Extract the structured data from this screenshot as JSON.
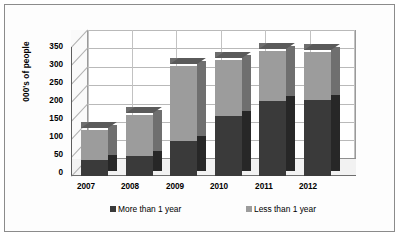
{
  "chart_data": {
    "type": "bar",
    "subtype": "stacked-3d-column",
    "title": "",
    "xlabel": "",
    "ylabel": "000's of people",
    "categories": [
      "2007",
      "2008",
      "2009",
      "2010",
      "2011",
      "2012"
    ],
    "series": [
      {
        "name": "More than 1 year",
        "color": "#3a3a3a",
        "values": [
          45,
          55,
          95,
          165,
          205,
          208
        ]
      },
      {
        "name": "Less than 1 year",
        "color": "#9c9c9c",
        "values": [
          80,
          112,
          205,
          153,
          138,
          132
        ]
      }
    ],
    "totals": [
      125,
      167,
      300,
      318,
      343,
      340
    ],
    "ylim": [
      0,
      350
    ],
    "yticks": [
      "350",
      "300",
      "250",
      "200",
      "150",
      "100",
      "50",
      "0"
    ],
    "ytick_values": [
      350,
      300,
      250,
      200,
      150,
      100,
      50,
      0
    ],
    "ytick_step": 50,
    "grid": true,
    "legend_position": "bottom",
    "legend": [
      "More than 1 year",
      "Less than 1 year"
    ]
  },
  "colors": {
    "series_dark": "#3a3a3a",
    "series_light": "#9c9c9c",
    "border": "#8b8b8b",
    "gridline": "#b9b9b9",
    "plot_background": "#ffffff",
    "page_background": "#ffffff"
  }
}
